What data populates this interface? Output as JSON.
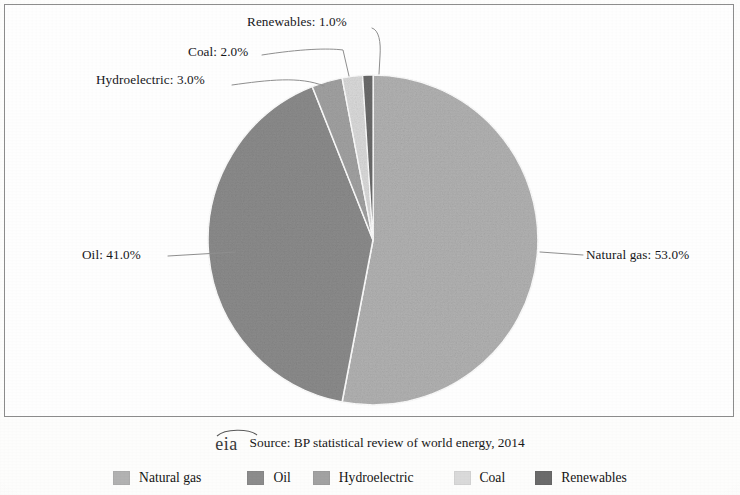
{
  "chart_data": {
    "type": "pie",
    "title": "",
    "categories": [
      "Natural gas",
      "Oil",
      "Hydroelectric",
      "Coal",
      "Renewables"
    ],
    "values": [
      53.0,
      41.0,
      3.0,
      2.0,
      1.0
    ],
    "value_unit": "%",
    "start_angle_deg": 0,
    "direction": "clockwise",
    "legend_position": "bottom",
    "grid": false,
    "colors": [
      "#b2b2b2",
      "#8c8c8c",
      "#a2a2a2",
      "#dadada",
      "#6b6b6b"
    ],
    "slice_labels": [
      "Natural gas: 53.0%",
      "Oil: 41.0%",
      "Hydroelectric: 3.0%",
      "Coal: 2.0%",
      "Renewables: 1.0%"
    ],
    "source_note": "Source: BP statistical review of world energy, 2014"
  },
  "callouts": {
    "renewables": "Renewables: 1.0%",
    "coal": "Coal: 2.0%",
    "hydroelectric": "Hydroelectric: 3.0%",
    "oil": "Oil: 41.0%",
    "natural_gas": "Natural gas: 53.0%"
  },
  "footer": {
    "logo_text": "eia",
    "source": "Source: BP statistical review of world energy, 2014"
  },
  "legend": {
    "items": [
      {
        "label": "Natural gas",
        "color": "#b2b2b2"
      },
      {
        "label": "Oil",
        "color": "#8c8c8c"
      },
      {
        "label": "Hydroelectric",
        "color": "#a2a2a2"
      },
      {
        "label": "Coal",
        "color": "#dadada"
      },
      {
        "label": "Renewables",
        "color": "#6b6b6b"
      }
    ]
  }
}
